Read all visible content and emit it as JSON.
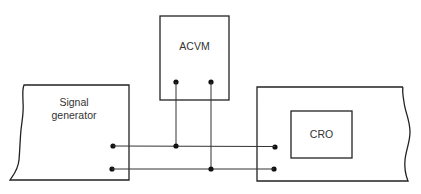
{
  "diagram": {
    "type": "circuit-connection",
    "components": {
      "acvm": {
        "label": "ACVM"
      },
      "signal_generator": {
        "label_line1": "Signal",
        "label_line2": "generator"
      },
      "cro": {
        "label": "CRO"
      }
    },
    "connections": [
      {
        "from": "signal_generator.terminal_top",
        "to": "cro_unit.terminal_top",
        "via": "acvm.terminal_left"
      },
      {
        "from": "signal_generator.terminal_bottom",
        "to": "cro_unit.terminal_bottom",
        "via": "acvm.terminal_right"
      }
    ]
  }
}
